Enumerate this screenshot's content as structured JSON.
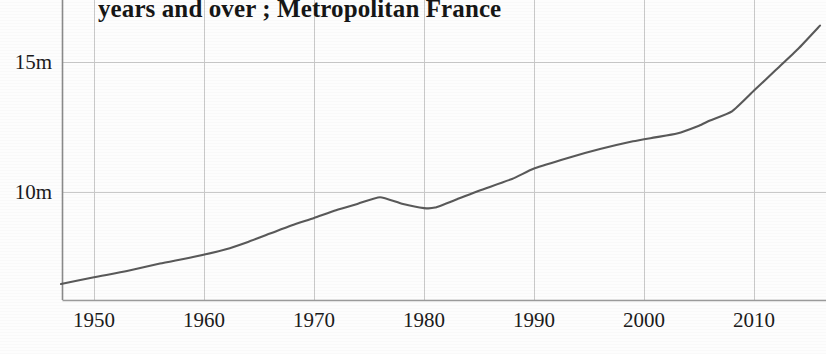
{
  "chart_data": {
    "type": "line",
    "title": "years and over ; Metropolitan France",
    "title_truncated_note": "second line of a two-line wrapped title; first line cut off above image edge",
    "xlabel": "",
    "ylabel": "",
    "xlim": [
      1947,
      2016
    ],
    "ylim": [
      6.0,
      16.8
    ],
    "grid": true,
    "legend": "none",
    "y_ticks": [
      {
        "value": 10,
        "label": "10m"
      },
      {
        "value": 15,
        "label": "15m"
      }
    ],
    "x_ticks": [
      {
        "value": 1950,
        "label": "1950"
      },
      {
        "value": 1960,
        "label": "1960"
      },
      {
        "value": 1970,
        "label": "1970"
      },
      {
        "value": 1980,
        "label": "1980"
      },
      {
        "value": 1990,
        "label": "1990"
      },
      {
        "value": 2000,
        "label": "2000"
      },
      {
        "value": 2010,
        "label": "2010"
      }
    ],
    "series": [
      {
        "name": "population",
        "color": "#595959",
        "x": [
          1947,
          1950,
          1953,
          1956,
          1959,
          1962,
          1964,
          1966,
          1968,
          1970,
          1972,
          1974,
          1976,
          1978,
          1980,
          1981,
          1983,
          1985,
          1988,
          1990,
          1993,
          1996,
          1999,
          2001,
          2003,
          2005,
          2006,
          2008,
          2010,
          2012,
          2014,
          2016
        ],
        "values": [
          6.46,
          6.72,
          6.96,
          7.25,
          7.5,
          7.8,
          8.08,
          8.4,
          8.72,
          9.0,
          9.3,
          9.55,
          9.8,
          9.55,
          9.38,
          9.4,
          9.72,
          10.05,
          10.5,
          10.9,
          11.3,
          11.65,
          11.95,
          12.1,
          12.25,
          12.55,
          12.75,
          13.1,
          13.9,
          14.7,
          15.5,
          16.4
        ]
      }
    ]
  },
  "axes": {
    "y_axis_name": "y-axis",
    "x_axis_name": "x-axis"
  }
}
